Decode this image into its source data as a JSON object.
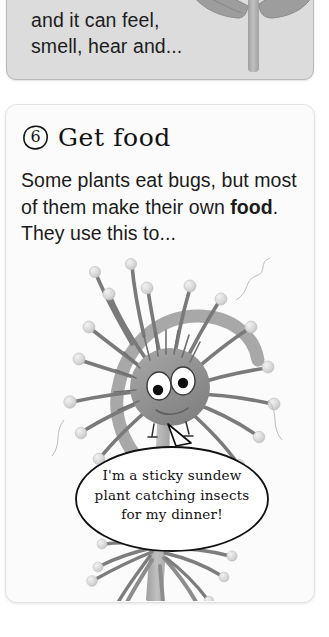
{
  "page": {
    "background": "#ffffff",
    "width": 329,
    "height": 637
  },
  "previous_card": {
    "name": "previous-section-card",
    "background": "#dcdcdc",
    "text": "and it can feel,\nsmell, hear and..."
  },
  "main_card": {
    "name": "section-card-get-food",
    "background": "#fbfbfb",
    "step_number": "6",
    "heading": "Get food",
    "body_before_bold": "Some plants eat bugs, but most of them make their own ",
    "body_bold": "food",
    "body_after_bold": ". They use this to..."
  },
  "illustration": {
    "name": "sundew-plant-illustration",
    "subject": "sundew-plant-with-face",
    "stem_color": "#b3b3b3",
    "head_color": "#8f8f8f",
    "tentacle_color": "#7d7d7d",
    "blob_color": "#d9d9d9",
    "eye_white": "#ffffff",
    "pupil_color": "#101010",
    "leaf_color": "#9d9d9d"
  },
  "speech_bubble": {
    "name": "sundew-speech-bubble",
    "text": "I'm a sticky sundew\nplant catching insects\nfor my dinner!",
    "fill": "#ffffff",
    "stroke": "#111111"
  }
}
